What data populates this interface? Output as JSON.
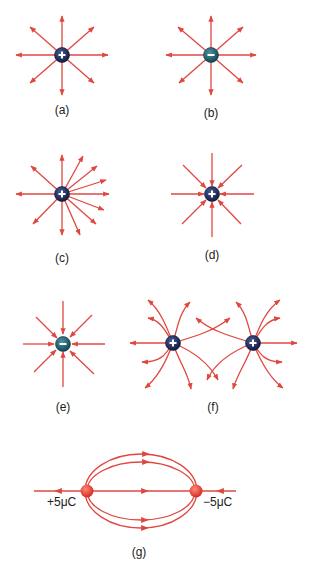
{
  "figure": {
    "panels": [
      {
        "id": "a",
        "label": "(a)",
        "description": "Isolated positive charge, 8 field lines radiating outward"
      },
      {
        "id": "b",
        "label": "(b)",
        "description": "Isolated negative charge drawn with 8 lines radiating outward"
      },
      {
        "id": "c",
        "label": "(c)",
        "description": "Positive charge with asymmetric, denser outward field lines on right"
      },
      {
        "id": "d",
        "label": "(d)",
        "description": "Positive charge with 8 field lines pointing inward"
      },
      {
        "id": "e",
        "label": "(e)",
        "description": "Negative charge with 8 field lines pointing inward"
      },
      {
        "id": "f",
        "label": "(f)",
        "description": "Two positive charges with crossing field lines"
      },
      {
        "id": "g",
        "label": "(g)",
        "description": "Dipole +5μC and −5μC with field lines",
        "charge_left": "+5μC",
        "charge_right": "−5μC"
      }
    ],
    "colors": {
      "field_line": "#e0473f",
      "positive_charge": "#1c2a5a",
      "negative_charge": "#1f5f6e",
      "dipole_charge": "#e23a2e",
      "label_text": "#222222"
    }
  }
}
